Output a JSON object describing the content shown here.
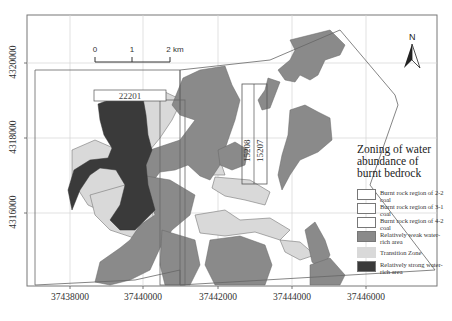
{
  "title": "Zoning of water abundance of burnt bedrock",
  "title_lines": [
    "Zoning of water",
    "abundance of",
    "burnt bedrock"
  ],
  "north_arrow": {
    "label": "N",
    "icon": "north-arrow-icon"
  },
  "scale_bar": {
    "ticks": [
      "0",
      "1",
      "2 km"
    ],
    "unit": "km"
  },
  "panel_labels": {
    "panel_a": "22201",
    "panel_b_1": "15208",
    "panel_b_2": "15207"
  },
  "axes": {
    "x_ticks": [
      "37438000",
      "37440000",
      "37442000",
      "37444000",
      "37446000"
    ],
    "y_ticks": [
      "4320000",
      "4318000",
      "4316000"
    ]
  },
  "legend": {
    "items": [
      {
        "label": "Burnt rock region of 2-2 coal",
        "color": "#ffffff"
      },
      {
        "label": "Burnt rock region of 3-1 coal",
        "color": "#ffffff"
      },
      {
        "label": "Burnt rock region of 4-2 coal",
        "color": "#ffffff"
      },
      {
        "label": "Relatively weak water-rich area",
        "color": "#8a8a8a"
      },
      {
        "label": "Transition Zone",
        "color": "#d9d9d9"
      },
      {
        "label": "Relatively strong water-rich area",
        "color": "#3a3a3a"
      }
    ]
  },
  "colors": {
    "weak": "#8a8a8a",
    "transition": "#d9d9d9",
    "strong": "#3a3a3a",
    "outline": "#666666",
    "grid": "#cfcfcf"
  }
}
